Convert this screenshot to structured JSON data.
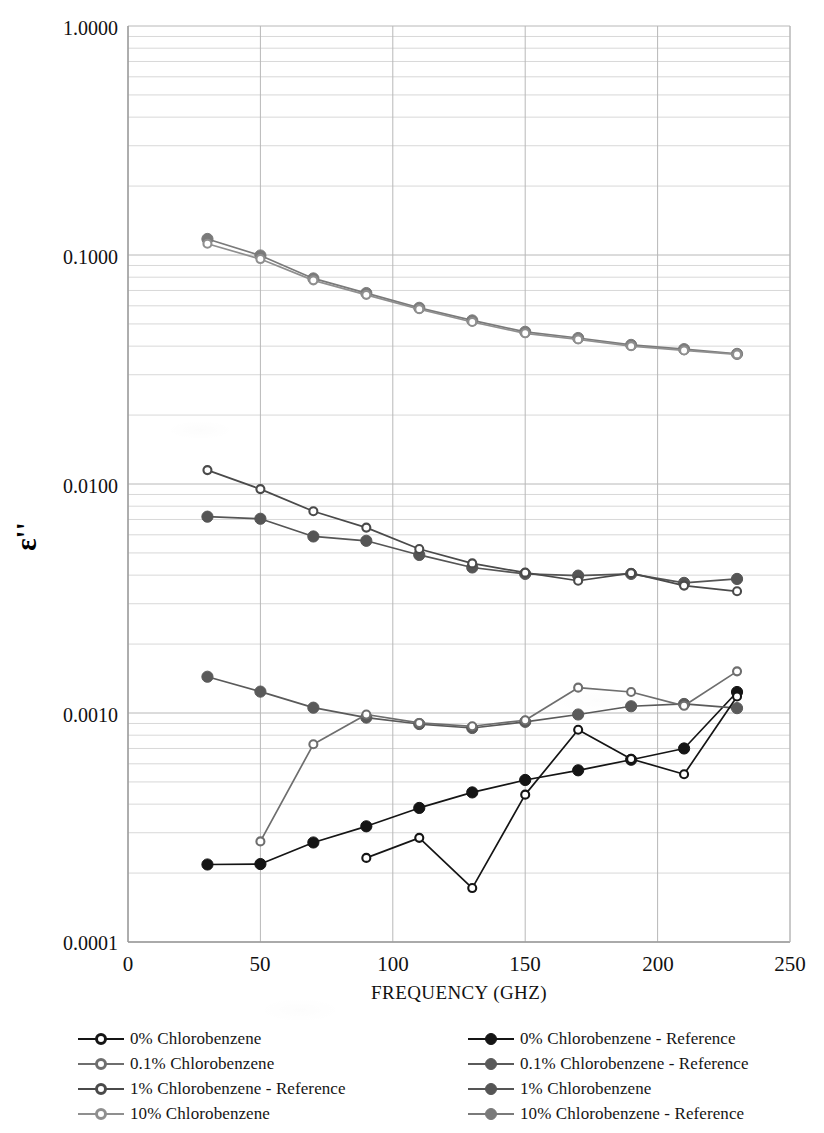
{
  "chart_data": {
    "type": "line",
    "title": "",
    "xlabel": "FREQUENCY (GHZ)",
    "ylabel": "ε''",
    "yscale": "log",
    "xlim": [
      0,
      250
    ],
    "ylim": [
      0.0001,
      1.0
    ],
    "grid": true,
    "minor_grid": true,
    "legend_position": "bottom",
    "xticks": [
      "0",
      "50",
      "100",
      "150",
      "200",
      "250"
    ],
    "xtick_values": [
      0,
      50,
      100,
      150,
      200,
      250
    ],
    "yticks": [
      "0.0001",
      "0.0010",
      "0.0100",
      "0.1000",
      "1.0000"
    ],
    "ytick_values": [
      0.0001,
      0.001,
      0.01,
      0.1,
      1.0
    ],
    "x": [
      30,
      50,
      70,
      90,
      110,
      130,
      150,
      170,
      190,
      210,
      230
    ],
    "series": [
      {
        "name": "0% Chlorobenzene",
        "color": "#151515",
        "marker": "open",
        "x": [
          90,
          110,
          130,
          150,
          170,
          190,
          210,
          230
        ],
        "values": [
          0.000233,
          0.000285,
          0.000172,
          0.00044,
          0.000845,
          0.00063,
          0.00054,
          0.00118
        ]
      },
      {
        "name": "0.1% Chlorobenzene",
        "color": "#6e6e6e",
        "marker": "open",
        "x": [
          50,
          70,
          90,
          110,
          130,
          150,
          170,
          190,
          210,
          230
        ],
        "values": [
          0.000275,
          0.00073,
          0.000985,
          0.000905,
          0.000875,
          0.00093,
          0.00129,
          0.001235,
          0.001075,
          0.00152
        ]
      },
      {
        "name": "1% Chlorobenzene - Reference",
        "color": "#4a4a4a",
        "marker": "open",
        "x": [
          30,
          50,
          70,
          90,
          110,
          130,
          150,
          170,
          190,
          210,
          230
        ],
        "values": [
          0.0115,
          0.0095,
          0.0076,
          0.00645,
          0.0052,
          0.0045,
          0.0041,
          0.00378,
          0.00408,
          0.0036,
          0.0034
        ]
      },
      {
        "name": "10% Chlorobenzene",
        "color": "#8f8f8f",
        "marker": "open",
        "x": [
          30,
          50,
          70,
          90,
          110,
          130,
          150,
          170,
          190,
          210,
          230
        ],
        "values": [
          0.112,
          0.096,
          0.0775,
          0.067,
          0.058,
          0.051,
          0.0455,
          0.0428,
          0.04,
          0.0383,
          0.0368
        ]
      },
      {
        "name": "0% Chlorobenzene - Reference",
        "color": "#151515",
        "marker": "filled",
        "x": [
          30,
          50,
          70,
          90,
          110,
          130,
          150,
          170,
          190,
          210,
          230
        ],
        "values": [
          0.000218,
          0.000219,
          0.000272,
          0.00032,
          0.000385,
          0.00045,
          0.00051,
          0.000562,
          0.000625,
          0.0007,
          0.001235
        ]
      },
      {
        "name": "0.1% Chlorobenzene - Reference",
        "color": "#5a5a5a",
        "marker": "filled",
        "x": [
          30,
          50,
          70,
          90,
          110,
          130,
          150,
          170,
          190,
          210,
          230
        ],
        "values": [
          0.00144,
          0.00124,
          0.001055,
          0.000955,
          0.000895,
          0.00086,
          0.000915,
          0.000985,
          0.00107,
          0.001095,
          0.00105
        ]
      },
      {
        "name": "1% Chlorobenzene",
        "color": "#555555",
        "marker": "filled",
        "x": [
          30,
          50,
          70,
          90,
          110,
          130,
          150,
          170,
          190,
          210,
          230
        ],
        "values": [
          0.0072,
          0.00705,
          0.0059,
          0.00565,
          0.0049,
          0.00432,
          0.00405,
          0.00398,
          0.00405,
          0.0037,
          0.00385
        ]
      },
      {
        "name": "10% Chlorobenzene - Reference",
        "color": "#7a7a7a",
        "marker": "filled",
        "x": [
          30,
          50,
          70,
          90,
          110,
          130,
          150,
          170,
          190,
          210,
          230
        ],
        "values": [
          0.1175,
          0.0995,
          0.079,
          0.0682,
          0.0588,
          0.0518,
          0.0462,
          0.0434,
          0.0405,
          0.0388,
          0.037
        ]
      }
    ]
  },
  "axes": {
    "y_title": "ε''",
    "x_title": "FREQUENCY (GHZ)",
    "ytick_labels": [
      "1.0000",
      "0.1000",
      "0.0100",
      "0.0010",
      "0.0001"
    ],
    "xtick_labels": [
      "0",
      "50",
      "100",
      "150",
      "200",
      "250"
    ]
  },
  "legend": {
    "left_column": [
      {
        "label": "0% Chlorobenzene",
        "color": "#151515",
        "marker": "open"
      },
      {
        "label": "0.1% Chlorobenzene",
        "color": "#6e6e6e",
        "marker": "open"
      },
      {
        "label": "1% Chlorobenzene -  Reference",
        "color": "#4a4a4a",
        "marker": "open"
      },
      {
        "label": "10% Chlorobenzene",
        "color": "#8f8f8f",
        "marker": "open"
      }
    ],
    "right_column": [
      {
        "label": "0% Chlorobenzene - Reference",
        "color": "#151515",
        "marker": "filled"
      },
      {
        "label": "0.1% Chlorobenzene - Reference",
        "color": "#5a5a5a",
        "marker": "filled"
      },
      {
        "label": "1% Chlorobenzene",
        "color": "#555555",
        "marker": "filled"
      },
      {
        "label": "10% Chlorobenzene - Reference",
        "color": "#7a7a7a",
        "marker": "filled"
      }
    ]
  },
  "colors": {
    "axis": "#9a9a9a",
    "major_grid": "#b8b8b8",
    "minor_grid": "#d8d8d8",
    "background": "#ffffff",
    "text": "#111111"
  }
}
